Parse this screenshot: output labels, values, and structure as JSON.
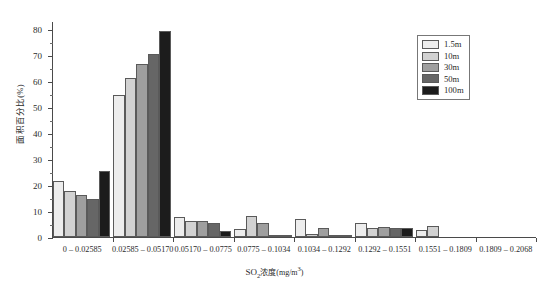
{
  "chart_data": {
    "type": "bar",
    "title": "",
    "xlabel": "SO₂浓度(mg/m³)",
    "xlabel_parts": {
      "prefix": "SO",
      "sub": "2",
      "middle": "浓度(mg/m",
      "sup": "3",
      "suffix": ")"
    },
    "ylabel": "面积百分比(%)",
    "ylim": [
      0,
      83
    ],
    "yticks": [
      0,
      10,
      20,
      30,
      40,
      50,
      60,
      70,
      80
    ],
    "ytick_labels": [
      "0",
      "10",
      "20",
      "30",
      "40",
      "50",
      "60",
      "70",
      "80"
    ],
    "grid": false,
    "legend_position": "top-right",
    "categories": [
      "0 – 0.02585",
      "0.02585 – 0.05170",
      "0.05170 – 0.0775",
      "0.0775 – 0.1034",
      "0.1034 – 0.1292",
      "0.1292 – 0.1551",
      "0.1551 – 0.1809",
      "0.1809 – 0.2068"
    ],
    "series": [
      {
        "name": "1.5m",
        "color": "#ededed",
        "values": [
          21.5,
          54.5,
          7.5,
          3.0,
          7.0,
          5.3,
          2.6,
          0.0
        ]
      },
      {
        "name": "10m",
        "color": "#d2d2d2",
        "values": [
          17.5,
          61.0,
          6.2,
          8.0,
          1.0,
          3.4,
          4.4,
          0.0
        ]
      },
      {
        "name": "30m",
        "color": "#9f9f9f",
        "values": [
          16.0,
          66.5,
          6.2,
          5.5,
          3.5,
          3.8,
          0.0,
          0.0
        ]
      },
      {
        "name": "50m",
        "color": "#666666",
        "values": [
          14.5,
          70.5,
          5.2,
          0.6,
          0.5,
          3.6,
          0.0,
          0.0
        ]
      },
      {
        "name": "100m",
        "color": "#1c1c1c",
        "values": [
          25.5,
          79.0,
          2.3,
          0.2,
          0.2,
          3.3,
          0.0,
          0.0
        ]
      }
    ]
  }
}
